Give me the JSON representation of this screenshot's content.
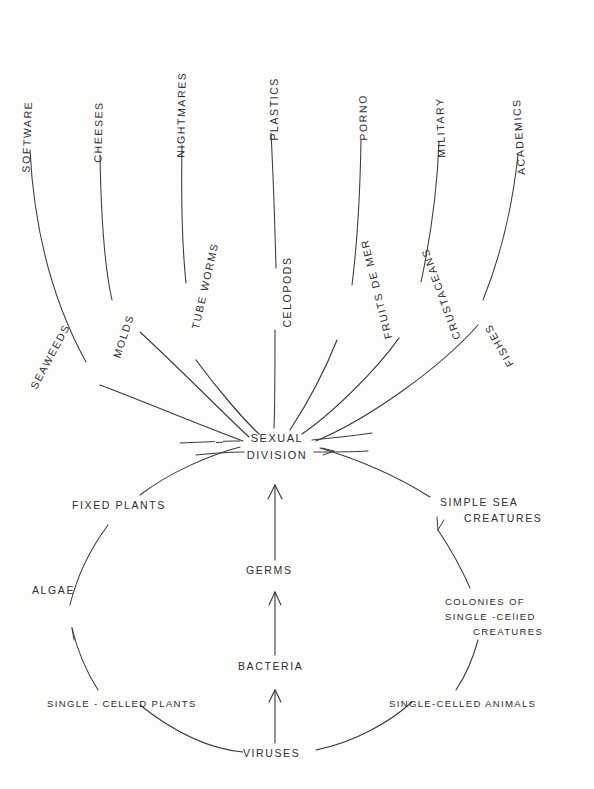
{
  "diagram": {
    "background_color": "#fdfdfc",
    "ink_color": "#2f2f32",
    "style": "hand-drawn pencil sketch"
  },
  "hub": {
    "label": "SEXUAL\nDIVISION",
    "line1": "SEXUAL",
    "line2": "DIVISION"
  },
  "outer_ring": [
    {
      "label": "SOFTWARE"
    },
    {
      "label": "CHEESES"
    },
    {
      "label": "NIGHTMARES"
    },
    {
      "label": "PLASTICS"
    },
    {
      "label": "PORNO"
    },
    {
      "label": "MILITARY"
    },
    {
      "label": "ACADEMICS"
    }
  ],
  "inner_ring": [
    {
      "label": "SEAWEEDS"
    },
    {
      "label": "MOLDS"
    },
    {
      "label": "TUBE WORMS"
    },
    {
      "label": "CELOPODS"
    },
    {
      "label": "FRUITS DE MER"
    },
    {
      "label": "CRUSTACEANS"
    },
    {
      "label": "FISHES"
    }
  ],
  "spine": [
    {
      "label": "GERMS"
    },
    {
      "label": "BACTERIA"
    },
    {
      "label": "VIRUSES"
    }
  ],
  "left_chain": [
    {
      "label": "FIXED PLANTS"
    },
    {
      "label": "ALGAE"
    },
    {
      "label": "SINGLE - CELLED PLANTS"
    }
  ],
  "right_chain": [
    {
      "label": "SIMPLE SEA\n    CREATURES",
      "line1": "SIMPLE SEA",
      "line2": "CREATURES"
    },
    {
      "label": "COLONIES OF\nSINGLE -CELLED\n      CREATURES",
      "line1": "COLONIES  OF",
      "line2": "SINGLE -CElIED",
      "line3": "CREATURES"
    },
    {
      "label": "SINGLE-CELLED ANIMALS"
    }
  ]
}
